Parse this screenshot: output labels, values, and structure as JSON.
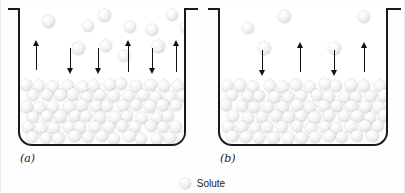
{
  "figure": {
    "background_color": "#fefefe",
    "outline_color": "#1a1a1a",
    "sphere_color": "#eeeeee",
    "arrow_color": "#111111"
  },
  "legend": {
    "label": "Solute",
    "swatch_icon": "sphere-icon"
  },
  "panels": [
    {
      "id": "a",
      "label": "(a)",
      "beaker": {
        "left": 18,
        "top": 8,
        "width": 168,
        "height": 138,
        "rim_left": 8,
        "rim_width": 190
      },
      "liquid_surface_y": 72,
      "vapor_spheres": [
        {
          "x": 22,
          "y": 7,
          "r": 6.5
        },
        {
          "x": 62,
          "y": 12,
          "r": 6.0
        },
        {
          "x": 78,
          "y": 1,
          "r": 6.5
        },
        {
          "x": 104,
          "y": 13,
          "r": 6.0
        },
        {
          "x": 126,
          "y": 16,
          "r": 5.8
        },
        {
          "x": 146,
          "y": 1,
          "r": 6.2
        },
        {
          "x": 160,
          "y": 13,
          "r": 6.0
        },
        {
          "x": 52,
          "y": 34,
          "r": 6.5
        },
        {
          "x": 80,
          "y": 32,
          "r": 6.2
        },
        {
          "x": 98,
          "y": 42,
          "r": 6.0
        },
        {
          "x": 132,
          "y": 32,
          "r": 6.3
        }
      ],
      "arrows": [
        {
          "x": 12,
          "y": 32,
          "len": 30,
          "dir": "up"
        },
        {
          "x": 46,
          "y": 40,
          "len": 26,
          "dir": "down"
        },
        {
          "x": 74,
          "y": 40,
          "len": 26,
          "dir": "down"
        },
        {
          "x": 104,
          "y": 32,
          "len": 32,
          "dir": "up"
        },
        {
          "x": 128,
          "y": 40,
          "len": 26,
          "dir": "down"
        },
        {
          "x": 152,
          "y": 32,
          "len": 32,
          "dir": "up"
        }
      ],
      "solution_rows": 6,
      "solution_density": "high"
    },
    {
      "id": "b",
      "label": "(b)",
      "beaker": {
        "left": 15,
        "top": 8,
        "width": 170,
        "height": 138,
        "rim_left": 5,
        "rim_width": 193
      },
      "liquid_surface_y": 72,
      "vapor_spheres": [
        {
          "x": 22,
          "y": 14,
          "r": 6.2
        },
        {
          "x": 58,
          "y": 2,
          "r": 6.5
        },
        {
          "x": 138,
          "y": 3,
          "r": 6.2
        },
        {
          "x": 38,
          "y": 34,
          "r": 6.4
        },
        {
          "x": 108,
          "y": 34,
          "r": 6.4
        }
      ],
      "arrows": [
        {
          "x": 38,
          "y": 42,
          "len": 26,
          "dir": "down"
        },
        {
          "x": 76,
          "y": 34,
          "len": 30,
          "dir": "up"
        },
        {
          "x": 110,
          "y": 42,
          "len": 26,
          "dir": "down"
        },
        {
          "x": 140,
          "y": 34,
          "len": 30,
          "dir": "up"
        }
      ],
      "solution_rows": 6,
      "solution_density": "high"
    }
  ]
}
